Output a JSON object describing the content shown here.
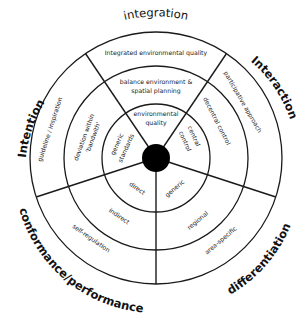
{
  "diagram": {
    "geometry": {
      "center": [
        156,
        158
      ],
      "ring_radii": [
        14,
        54,
        92,
        126
      ],
      "divider_angles_deg": [
        -124,
        -56,
        18,
        90,
        162
      ]
    },
    "outer_labels": {
      "top": "integration",
      "right": "Interaction",
      "left": "Intention",
      "bottom_left": "conformance/performance",
      "bottom_right": "differentiation"
    },
    "sectors": {
      "integration": {
        "outer": "Integrated environmental quality",
        "middle_line1": "balance environment &",
        "middle_line2": "spatial planning",
        "inner_line1": "environmental",
        "inner_line2": "quality"
      },
      "interaction": {
        "outer": "participative approach",
        "middle": "decentral control",
        "inner_line1": "central",
        "inner_line2": "control"
      },
      "differentiation": {
        "outer": "area-specific",
        "middle": "regional",
        "inner": "generic"
      },
      "conformance": {
        "outer": "self-regulation",
        "middle": "indirect",
        "inner": "direct"
      },
      "intention": {
        "outer": "guideline / inspiration",
        "middle_line1": "deviation within",
        "middle_line2": "'bandwith'",
        "inner_line1": "generic",
        "inner_line2": "standards"
      }
    },
    "colors": {
      "line": "#1a1a1a",
      "hub": "#000000",
      "background": "#ffffff"
    }
  }
}
